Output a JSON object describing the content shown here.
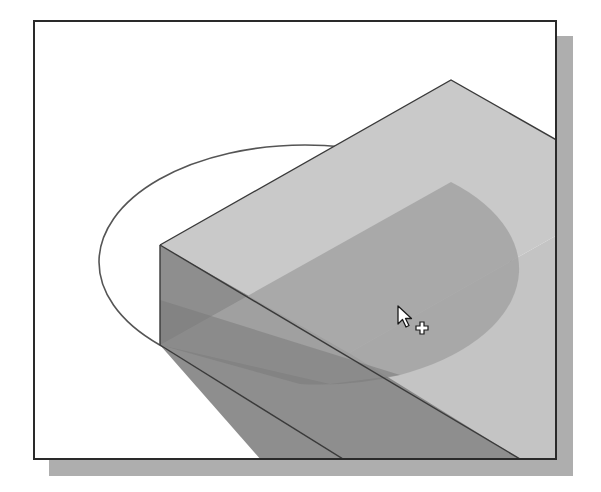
{
  "viewport": {
    "background": "#ffffff",
    "frame": {
      "x": 33,
      "y": 20,
      "width": 524,
      "height": 440,
      "border": "#2a2a2a"
    },
    "shadow": {
      "offset_x": 16,
      "offset_y": 16,
      "color": "#aeaeae"
    }
  },
  "model": {
    "name": "isometric-block-with-semicircular-sketch",
    "colors": {
      "top_face": "#c9c9c9",
      "front_face": "#8e8e8e",
      "side_face": "#9f9f9f",
      "profile_fill_top": "#a3a3a3",
      "profile_fill_front": "#7a7a7a",
      "edge": "#3a3a3a",
      "ellipse_outline": "#555555"
    }
  },
  "cursor": {
    "type": "arrow-with-plus",
    "x": 398,
    "y": 306
  }
}
